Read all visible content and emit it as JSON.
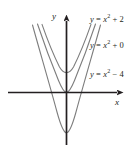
{
  "figure": {
    "background_color": "#ffffff",
    "axis_color": "#231f20",
    "curve_color": "#7d7d7d",
    "text_color": "#231f20"
  },
  "axes": {
    "x_label": "x",
    "y_label": "y"
  },
  "chart_data": {
    "type": "line",
    "title": "",
    "xlabel": "x",
    "ylabel": "y",
    "xlim": [
      -5.8,
      5.8
    ],
    "ylim": [
      -5.5,
      7.9
    ],
    "grid": false,
    "legend": "inline-curve-labels",
    "series": [
      {
        "name": "y = x² + 2",
        "label_html": "y <span class=\"op\">=</span> x<sup>2</sup> <span class=\"op\">+</span> <span class=\"num\">2</span>",
        "equation": "y = x^2 + 2",
        "a": 1,
        "c": 2,
        "vertex": [
          0,
          2
        ],
        "x": [
          -2.4,
          -1.8,
          -1.2,
          -0.6,
          0,
          0.6,
          1.2,
          1.8,
          2.4
        ],
        "y": [
          7.76,
          5.24,
          3.44,
          2.36,
          2,
          2.36,
          3.44,
          5.24,
          7.76
        ]
      },
      {
        "name": "y = x² + 0",
        "label_html": "y <span class=\"op\">=</span> x<sup>2</sup> <span class=\"op\">+</span> <span class=\"num\">0</span>",
        "equation": "y = x^2 + 0",
        "a": 1,
        "c": 0,
        "vertex": [
          0,
          0
        ],
        "x": [
          -2.8,
          -2.1,
          -1.4,
          -0.7,
          0,
          0.7,
          1.4,
          2.1,
          2.8
        ],
        "y": [
          7.84,
          4.41,
          1.96,
          0.49,
          0,
          0.49,
          1.96,
          4.41,
          7.84
        ]
      },
      {
        "name": "y = x² − 4",
        "label_html": "y <span class=\"op\">=</span> x<sup>2</sup> <span class=\"op\">−</span> <span class=\"num\">4</span>",
        "equation": "y = x^2 - 4",
        "a": 1,
        "c": -4,
        "vertex": [
          0,
          -4
        ],
        "x": [
          -3.4,
          -2.55,
          -1.7,
          -0.85,
          0,
          0.85,
          1.7,
          2.55,
          3.4
        ],
        "y": [
          7.56,
          2.5,
          -1.11,
          -3.28,
          -4,
          -3.28,
          -1.11,
          2.5,
          7.56
        ]
      }
    ]
  }
}
